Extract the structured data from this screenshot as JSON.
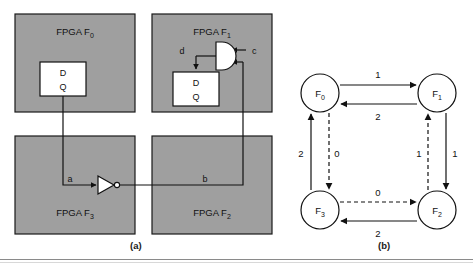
{
  "figure": {
    "captions": {
      "left": "(a)",
      "right": "(b)"
    }
  },
  "colors": {
    "fpga_fill": "#9f9f9f",
    "fpga_border": "#1a1a1a",
    "ff_fill": "#ffffff",
    "wire": "#111111",
    "background": "#ffffff"
  },
  "panel_a": {
    "name": "fpga-interconnect-schematic",
    "blocks": [
      {
        "id": "F0",
        "label_prefix": "FPGA F",
        "label_sub": "0",
        "x": 15,
        "y": 14,
        "w": 120,
        "h": 98
      },
      {
        "id": "F1",
        "label_prefix": "FPGA F",
        "label_sub": "1",
        "x": 152,
        "y": 14,
        "w": 120,
        "h": 98
      },
      {
        "id": "F3",
        "label_prefix": "FPGA F",
        "label_sub": "3",
        "x": 15,
        "y": 136,
        "w": 120,
        "h": 98
      },
      {
        "id": "F2",
        "label_prefix": "FPGA F",
        "label_sub": "2",
        "x": 152,
        "y": 136,
        "w": 120,
        "h": 98
      }
    ],
    "flipflops": [
      {
        "id": "ff-f0",
        "d": "D",
        "q": "Q",
        "x": 40,
        "y": 62,
        "w": 46,
        "h": 34
      },
      {
        "id": "ff-f1",
        "d": "D",
        "q": "Q",
        "x": 173,
        "y": 72,
        "w": 46,
        "h": 34
      }
    ],
    "gates": [
      {
        "id": "and-gate-f1",
        "type": "and-gate"
      },
      {
        "id": "inverter-f3",
        "type": "inverter"
      }
    ],
    "signals": [
      {
        "id": "a",
        "label": "a",
        "x": 70,
        "y": 182
      },
      {
        "id": "b",
        "label": "b",
        "x": 205,
        "y": 182
      },
      {
        "id": "c",
        "label": "c",
        "x": 249,
        "y": 51
      },
      {
        "id": "d",
        "label": "d",
        "x": 180,
        "y": 51
      }
    ]
  },
  "panel_b": {
    "name": "communication-graph",
    "nodes": [
      {
        "id": "F0",
        "prefix": "F",
        "sub": "0",
        "cx": 320,
        "cy": 93,
        "r": 19
      },
      {
        "id": "F1",
        "prefix": "F",
        "sub": "1",
        "cx": 437,
        "cy": 93,
        "r": 19
      },
      {
        "id": "F3",
        "prefix": "F",
        "sub": "3",
        "cx": 320,
        "cy": 210,
        "r": 19
      },
      {
        "id": "F2",
        "prefix": "F",
        "sub": "2",
        "cx": 437,
        "cy": 210,
        "r": 19
      }
    ],
    "edges": [
      {
        "id": "F0-F1",
        "from": "F0",
        "to": "F1",
        "label": "1",
        "style": "solid",
        "lx": 378,
        "ly": 76
      },
      {
        "id": "F1-F0",
        "from": "F1",
        "to": "F0",
        "label": "2",
        "style": "solid",
        "lx": 378,
        "ly": 117
      },
      {
        "id": "F3-F0",
        "from": "F3",
        "to": "F0",
        "label": "2",
        "style": "solid",
        "lx": 300,
        "ly": 155
      },
      {
        "id": "F0-F3",
        "from": "F0",
        "to": "F3",
        "label": "0",
        "style": "dashed",
        "lx": 332,
        "ly": 155
      },
      {
        "id": "F2-F1",
        "from": "F2",
        "to": "F1",
        "label": "1",
        "style": "dashed",
        "lx": 413,
        "ly": 155
      },
      {
        "id": "F1-F2",
        "from": "F1",
        "to": "F2",
        "label": "1",
        "style": "solid",
        "lx": 449,
        "ly": 155
      },
      {
        "id": "F3-F2",
        "from": "F3",
        "to": "F2",
        "label": "0",
        "style": "dashed",
        "lx": 378,
        "ly": 193
      },
      {
        "id": "F2-F3",
        "from": "F2",
        "to": "F3",
        "label": "2",
        "style": "solid",
        "lx": 378,
        "ly": 234
      }
    ]
  }
}
